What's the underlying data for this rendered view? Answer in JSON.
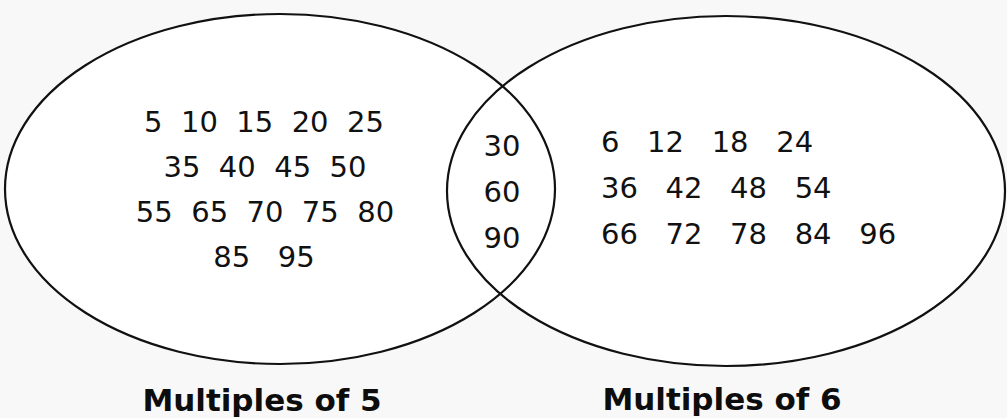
{
  "diagram": {
    "type": "venn",
    "sets": [
      {
        "label": "Multiples of 5",
        "only_rows": [
          "5  10  15  20  25",
          "35  40  45  50",
          "55  65  70  75  80",
          "85   95"
        ],
        "only_values": [
          5,
          10,
          15,
          20,
          25,
          35,
          40,
          45,
          50,
          55,
          65,
          70,
          75,
          80,
          85,
          95
        ]
      },
      {
        "label": "Multiples of 6",
        "only_rows": [
          "6   12   18   24",
          "36   42   48   54",
          "66   72   78   84   96"
        ],
        "only_values": [
          6,
          12,
          18,
          24,
          36,
          42,
          48,
          54,
          66,
          72,
          78,
          84,
          96
        ]
      }
    ],
    "intersection": {
      "rows": [
        "30",
        "60",
        "90"
      ],
      "values": [
        30,
        60,
        90
      ]
    },
    "colors": {
      "background": "#f8f8f8",
      "fill": "#ffffff",
      "stroke": "#111111",
      "text": "#111111"
    }
  }
}
